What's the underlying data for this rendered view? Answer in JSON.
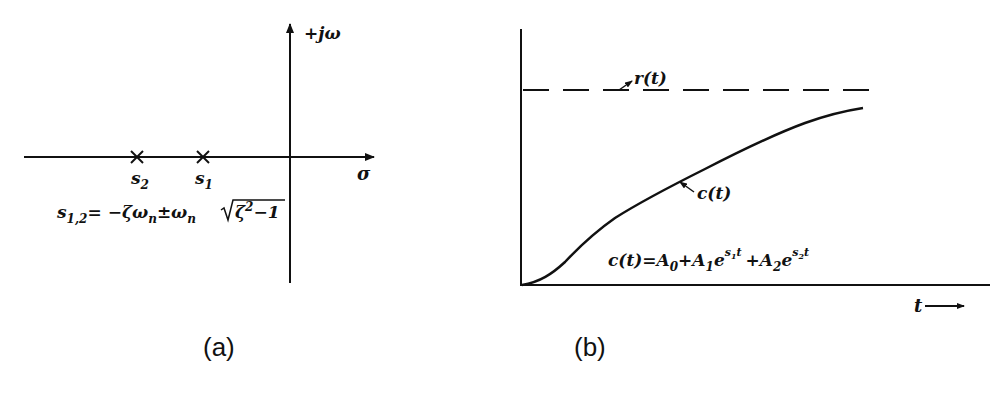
{
  "panel_a": {
    "caption": "(a)",
    "imag_axis_label": "+jω",
    "real_axis_label": "σ",
    "poles": [
      {
        "label": "s",
        "subscript": "2",
        "x": 137
      },
      {
        "label": "s",
        "subscript": "1",
        "x": 203
      }
    ],
    "pole_formula": {
      "lhs": "s",
      "lhs_sub": "1,2",
      "rhs_part1": "= −ζω",
      "rhs_sub1": "n",
      "rhs_part2": "±ω",
      "rhs_sub2": "n",
      "sqrt_content": "ζ",
      "sqrt_exp": "2",
      "sqrt_tail": "−1"
    }
  },
  "panel_b": {
    "caption": "(b)",
    "reference_label": "r(t)",
    "response_label": "c(t)",
    "time_axis_label": "t",
    "response_formula": {
      "lhs": "c(t)=A",
      "sub0": "0",
      "plus1": "+A",
      "sub1": "1",
      "e1": "e",
      "exp1": "s",
      "exp1_sub": "1",
      "exp1_t": "t",
      "plus2": "+A",
      "sub2": "2",
      "e2": "e",
      "exp2": "s",
      "exp2_sub": "2",
      "exp2_t": "t"
    }
  },
  "colors": {
    "ink": "#111111",
    "background": "#ffffff"
  }
}
